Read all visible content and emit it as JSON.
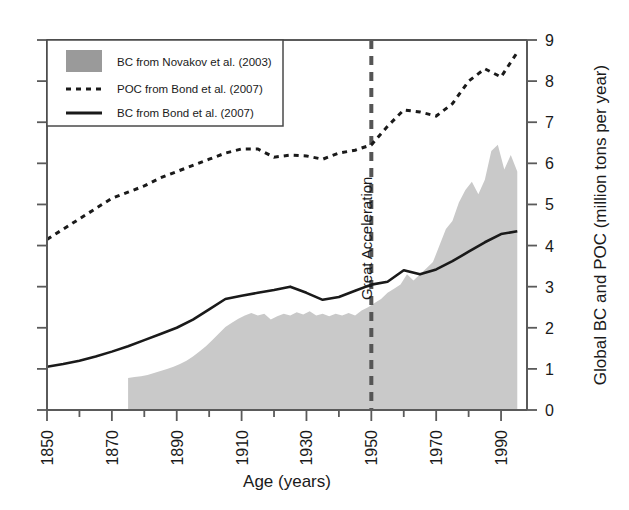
{
  "figure": {
    "background_color": "#ffffff",
    "plot_area": {
      "left": 47,
      "top": 40,
      "right": 527,
      "bottom": 410
    }
  },
  "chart_data": {
    "type": "area",
    "title": "",
    "subtitle": "",
    "xlabel": "Age (years)",
    "ylabel": "Global BC and POC (million tons per year)",
    "ylabel_side": "right",
    "xlim": [
      1850,
      1998
    ],
    "ylim": [
      0,
      9
    ],
    "xticks": [
      1850,
      1860,
      1870,
      1880,
      1890,
      1900,
      1910,
      1920,
      1930,
      1940,
      1950,
      1960,
      1970,
      1980,
      1990
    ],
    "xtick_labels": [
      "1850",
      "",
      "1870",
      "",
      "1890",
      "",
      "1910",
      "",
      "1930",
      "",
      "1950",
      "",
      "1970",
      "",
      "1990"
    ],
    "xtick_labels_rotated": true,
    "yticks": [
      0,
      1,
      2,
      3,
      4,
      5,
      6,
      7,
      8,
      9
    ],
    "ytick_labels": [
      "0",
      "1",
      "2",
      "3",
      "4",
      "5",
      "6",
      "7",
      "8",
      "9"
    ],
    "grid": false,
    "legend_position": "top-left",
    "annotations": [
      {
        "text": "Great Acceleration",
        "x": 1950,
        "orientation": "vertical",
        "line_style": "dashed",
        "color": "#555555"
      }
    ],
    "series": [
      {
        "name": "BC from Novakov et al. (2003)",
        "style": "area",
        "fill_color": "#c9c9c9",
        "x": [
          1875,
          1877,
          1879,
          1881,
          1883,
          1885,
          1887,
          1889,
          1891,
          1893,
          1895,
          1897,
          1899,
          1901,
          1903,
          1905,
          1907,
          1909,
          1911,
          1913,
          1915,
          1917,
          1919,
          1921,
          1923,
          1925,
          1927,
          1929,
          1931,
          1933,
          1935,
          1937,
          1939,
          1941,
          1943,
          1945,
          1947,
          1949,
          1951,
          1953,
          1955,
          1957,
          1959,
          1961,
          1963,
          1965,
          1967,
          1969,
          1971,
          1973,
          1975,
          1977,
          1979,
          1981,
          1983,
          1985,
          1987,
          1989,
          1991,
          1993,
          1995
        ],
        "values": [
          0.78,
          0.8,
          0.82,
          0.85,
          0.9,
          0.95,
          1.0,
          1.05,
          1.12,
          1.2,
          1.3,
          1.42,
          1.55,
          1.7,
          1.86,
          2.02,
          2.12,
          2.22,
          2.3,
          2.36,
          2.3,
          2.34,
          2.2,
          2.28,
          2.34,
          2.3,
          2.38,
          2.32,
          2.4,
          2.3,
          2.34,
          2.28,
          2.34,
          2.3,
          2.36,
          2.3,
          2.42,
          2.5,
          2.6,
          2.7,
          2.85,
          2.95,
          3.05,
          3.3,
          3.15,
          3.3,
          3.45,
          3.6,
          4.0,
          4.4,
          4.6,
          5.05,
          5.35,
          5.55,
          5.25,
          5.6,
          6.3,
          6.45,
          5.85,
          6.2,
          5.8
        ]
      },
      {
        "name": "POC from Bond et al. (2007)",
        "style": "dashed-line",
        "color": "#1a1a1a",
        "x": [
          1850,
          1855,
          1860,
          1865,
          1870,
          1875,
          1880,
          1885,
          1890,
          1895,
          1900,
          1905,
          1910,
          1915,
          1920,
          1925,
          1930,
          1935,
          1940,
          1945,
          1950,
          1955,
          1960,
          1965,
          1970,
          1975,
          1980,
          1985,
          1990,
          1995
        ],
        "values": [
          4.15,
          4.4,
          4.65,
          4.9,
          5.15,
          5.3,
          5.45,
          5.65,
          5.8,
          5.95,
          6.1,
          6.25,
          6.35,
          6.35,
          6.15,
          6.2,
          6.18,
          6.1,
          6.25,
          6.32,
          6.45,
          6.9,
          7.3,
          7.25,
          7.15,
          7.45,
          8.0,
          8.3,
          8.1,
          8.7
        ]
      },
      {
        "name": "BC from Bond et al. (2007)",
        "style": "solid-line",
        "color": "#1a1a1a",
        "x": [
          1850,
          1855,
          1860,
          1865,
          1870,
          1875,
          1880,
          1885,
          1890,
          1895,
          1900,
          1905,
          1910,
          1915,
          1920,
          1925,
          1930,
          1935,
          1940,
          1945,
          1950,
          1955,
          1960,
          1965,
          1970,
          1975,
          1980,
          1985,
          1990,
          1995
        ],
        "values": [
          1.05,
          1.12,
          1.2,
          1.3,
          1.42,
          1.55,
          1.7,
          1.85,
          2.0,
          2.2,
          2.45,
          2.7,
          2.78,
          2.85,
          2.92,
          3.0,
          2.85,
          2.68,
          2.75,
          2.9,
          3.05,
          3.12,
          3.4,
          3.3,
          3.42,
          3.62,
          3.85,
          4.08,
          4.28,
          4.35
        ]
      }
    ],
    "legend": {
      "entries": [
        {
          "label": "BC from Novakov et al. (2003)",
          "marker": "patch",
          "color": "#9a9a9a"
        },
        {
          "label": "POC from Bond et al. (2007)",
          "marker": "dashed",
          "color": "#1a1a1a"
        },
        {
          "label": "BC from Bond et al. (2007)",
          "marker": "solid",
          "color": "#1a1a1a"
        }
      ]
    }
  }
}
